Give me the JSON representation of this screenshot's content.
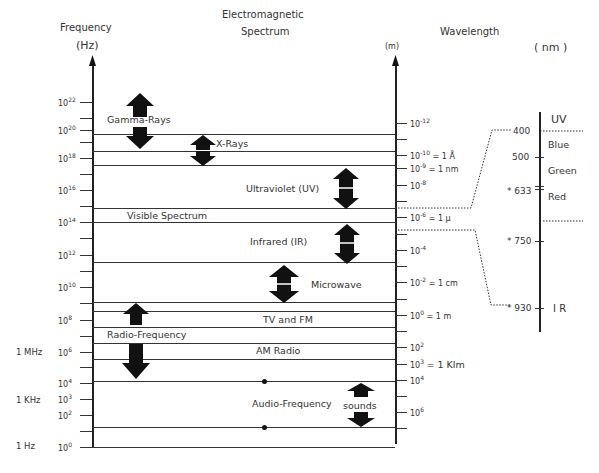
{
  "title": {
    "line1": "Electromagnetic",
    "line2": "Spectrum"
  },
  "left_axis": {
    "title": "Frequency",
    "unit": "(Hz)",
    "ticks": [
      {
        "label": "10",
        "exp": "22"
      },
      {
        "label": "10",
        "exp": "20"
      },
      {
        "label": "10",
        "exp": "18"
      },
      {
        "label": "10",
        "exp": "16"
      },
      {
        "label": "10",
        "exp": "14"
      },
      {
        "label": "10",
        "exp": "12"
      },
      {
        "label": "10",
        "exp": "10"
      },
      {
        "label": "10",
        "exp": "8"
      },
      {
        "label": "10",
        "exp": "6"
      },
      {
        "label": "10",
        "exp": "4"
      },
      {
        "label": "10",
        "exp": "3"
      },
      {
        "label": "10",
        "exp": "2"
      },
      {
        "label": "10",
        "exp": "0"
      }
    ],
    "named": [
      {
        "label": "1 MHz"
      },
      {
        "label": "1 KHz"
      },
      {
        "label": "1 Hz"
      }
    ]
  },
  "right_axis": {
    "title": "Wavelength",
    "unit": "(m)",
    "ticks": [
      {
        "label": "10",
        "exp": "-12",
        "note": ""
      },
      {
        "label": "10",
        "exp": "-10",
        "note": "= 1 Å"
      },
      {
        "label": "10",
        "exp": "-9",
        "note": "= 1 nm"
      },
      {
        "label": "10",
        "exp": "-8",
        "note": ""
      },
      {
        "label": "10",
        "exp": "-6",
        "note": "= 1 μ"
      },
      {
        "label": "10",
        "exp": "-4",
        "note": ""
      },
      {
        "label": "10",
        "exp": "-2",
        "note": "= 1 cm"
      },
      {
        "label": "10",
        "exp": "0",
        "note": "= 1 m"
      },
      {
        "label": "10",
        "exp": "2",
        "note": ""
      },
      {
        "label": "10",
        "exp": "3",
        "note": "= 1 Klm"
      },
      {
        "label": "10",
        "exp": "4",
        "note": ""
      },
      {
        "label": "10",
        "exp": "6",
        "note": ""
      }
    ]
  },
  "bands": [
    {
      "label": "Gamma-Rays"
    },
    {
      "label": "X-Rays"
    },
    {
      "label": "Ultraviolet (UV)"
    },
    {
      "label": "Visible Spectrum"
    },
    {
      "label": "Infrared (IR)"
    },
    {
      "label": "Microwave"
    },
    {
      "label": "TV and FM"
    },
    {
      "label": "Radio-Frequency"
    },
    {
      "label": "AM Radio"
    },
    {
      "label": "Audio-Frequency"
    },
    {
      "label": "sounds"
    }
  ],
  "visible_inset": {
    "unit": "( nm )",
    "ticks": [
      {
        "label": "400"
      },
      {
        "label": "500"
      },
      {
        "label": "* 633"
      },
      {
        "label": "* 750"
      },
      {
        "label": "* 930"
      }
    ],
    "regions": [
      {
        "label": "UV"
      },
      {
        "label": "Blue"
      },
      {
        "label": "Green"
      },
      {
        "label": "Red"
      },
      {
        "label": "I R"
      }
    ]
  }
}
